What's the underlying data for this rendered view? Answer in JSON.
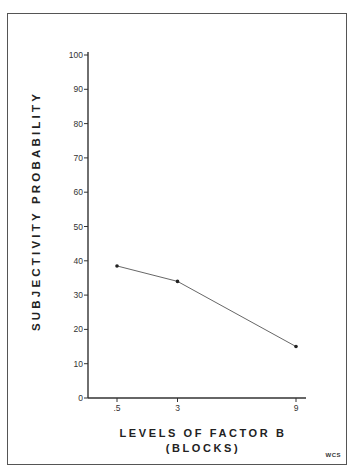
{
  "chart_data": {
    "type": "line",
    "title": "",
    "xlabel": "LEVELS OF FACTOR B",
    "xlabel_sub": "(BLOCKS)",
    "ylabel": "SUBJECTIVITY PROBABILITY",
    "categories": [
      ".5",
      "3",
      "9"
    ],
    "x": [
      0.5,
      3,
      9
    ],
    "values": [
      38.5,
      34,
      15
    ],
    "series": [
      {
        "name": "Subjectivity probability",
        "values": [
          38.5,
          34,
          15
        ]
      }
    ],
    "yticks": [
      0,
      10,
      20,
      30,
      40,
      50,
      60,
      70,
      80,
      90,
      100
    ],
    "xticks": [
      ".5",
      "3",
      "9"
    ],
    "ylim": [
      0,
      100
    ],
    "grid": false,
    "legend": null,
    "annotations": [
      "WCS"
    ]
  },
  "labels": {
    "ylabel": "SUBJECTIVITY PROBABILITY",
    "xlabel": "LEVELS OF FACTOR B",
    "xlabel_sub": "(BLOCKS)",
    "signature": "WCS"
  }
}
